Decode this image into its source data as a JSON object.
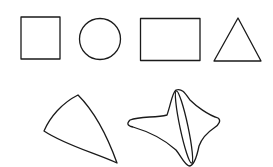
{
  "figure": {
    "stroke_color": "#1a1a1a",
    "background_color": "#ffffff",
    "rows": [
      {
        "name": "simple-shapes",
        "shapes": [
          {
            "label": "square"
          },
          {
            "label": "circle"
          },
          {
            "label": "rectangle"
          },
          {
            "label": "triangle"
          }
        ]
      },
      {
        "name": "irregular-shapes",
        "shapes": [
          {
            "label": "curved-triangle"
          },
          {
            "label": "four-pointed-star-with-inner-ellipse"
          }
        ]
      }
    ]
  }
}
